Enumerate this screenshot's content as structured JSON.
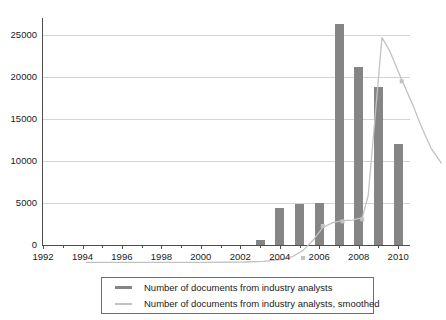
{
  "chart_data": {
    "type": "bar",
    "title": "",
    "xlabel": "",
    "ylabel": "",
    "xlim": [
      1992,
      2010.6
    ],
    "ylim": [
      0,
      27000
    ],
    "grid": true,
    "legend_position": "bottom",
    "y_ticks": [
      0,
      5000,
      10000,
      15000,
      20000,
      25000
    ],
    "y_tick_labels": [
      "0",
      "5000",
      "10000",
      "15000",
      "20000",
      "25000"
    ],
    "x_ticks": [
      1992,
      1994,
      1996,
      1998,
      2000,
      2002,
      2004,
      2006,
      2008,
      2010
    ],
    "x_tick_labels": [
      "1992",
      "1994",
      "1996",
      "1998",
      "2000",
      "2002",
      "2004",
      "2006",
      "2008",
      "2010"
    ],
    "x_minor_ticks": [
      1993,
      1995,
      1997,
      1999,
      2001,
      2003,
      2005,
      2007,
      2009
    ],
    "categories": [
      2003,
      2004,
      2005,
      2006,
      2007,
      2008,
      2009,
      2010
    ],
    "series": [
      {
        "name": "Number of documents from industry analysts",
        "kind": "bar",
        "color": "#858585",
        "values": [
          600,
          4400,
          4900,
          5000,
          26300,
          21200,
          18800,
          12000
        ]
      },
      {
        "name": "Number of documents from industry analysts, smoothed",
        "kind": "line",
        "color": "#c2c2c2",
        "x": [
          1992,
          1994,
          1996,
          1998,
          2000,
          2001,
          2002,
          2002.5,
          2003,
          2003.5,
          2004,
          2004.5,
          2005,
          2005.5,
          2006,
          2006.3,
          2006.6,
          2007,
          2007.4,
          2008,
          2008.6,
          2009,
          2009.5,
          2010
        ],
        "values": [
          60,
          60,
          70,
          80,
          120,
          200,
          450,
          800,
          1500,
          2700,
          4200,
          4800,
          5050,
          5100,
          5400,
          8000,
          16000,
          26800,
          25200,
          21800,
          18600,
          16200,
          13600,
          11900
        ]
      }
    ],
    "marker_points": [
      {
        "x": 2003,
        "y": 600
      },
      {
        "x": 2004,
        "y": 4400
      },
      {
        "x": 2005,
        "y": 4950
      },
      {
        "x": 2006,
        "y": 5200
      },
      {
        "x": 2008,
        "y": 21600
      }
    ]
  },
  "legend": {
    "entries": [
      {
        "label": "Number of documents from industry analysts",
        "color": "#858585",
        "style": "bar"
      },
      {
        "label": "Number of documents from industry analysts, smoothed",
        "color": "#c2c2c2",
        "style": "line"
      }
    ]
  }
}
